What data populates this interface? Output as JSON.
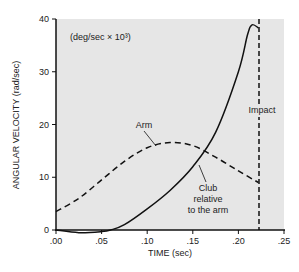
{
  "chart_data": {
    "type": "line",
    "title": "",
    "xlabel": "TIME (sec)",
    "ylabel": "ANGULAR VELOCITY (rad/sec)",
    "secondary_ylabel": "(deg/sec × 10³)",
    "xlim": [
      0,
      0.25
    ],
    "ylim": [
      0,
      40
    ],
    "x_ticks": [
      ".00",
      ".05",
      ".10",
      ".15",
      ".20",
      ".25"
    ],
    "y_ticks": [
      "0",
      "10",
      "20",
      "30",
      "40"
    ],
    "secondary_y_ticks": [
      "5",
      "10",
      "15",
      "20"
    ],
    "grid": false,
    "series": [
      {
        "name": "Arm",
        "style": "dashed",
        "x": [
          0.0,
          0.025,
          0.05,
          0.075,
          0.1,
          0.125,
          0.15,
          0.175,
          0.2,
          0.222
        ],
        "values": [
          3.5,
          6.0,
          9.5,
          13.0,
          15.6,
          16.6,
          16.0,
          13.8,
          11.2,
          9.0
        ]
      },
      {
        "name": "Club relative to the arm",
        "style": "solid",
        "x": [
          0.0,
          0.025,
          0.05,
          0.06,
          0.075,
          0.1,
          0.125,
          0.15,
          0.175,
          0.2,
          0.21,
          0.215,
          0.222
        ],
        "values": [
          0.0,
          -0.5,
          -0.3,
          0.0,
          1.0,
          4.0,
          7.5,
          12.0,
          18.5,
          30.0,
          37.0,
          38.9,
          38.3
        ]
      }
    ],
    "annotations": [
      {
        "text": "Impact",
        "x": 0.222,
        "type": "vertical-dashed-line"
      },
      {
        "text": "Arm",
        "x": 0.1,
        "y": 18.5
      },
      {
        "text": "Club relative to the arm",
        "x": 0.165,
        "y": 12
      }
    ]
  }
}
